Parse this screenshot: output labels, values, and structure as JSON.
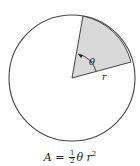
{
  "diagram": {
    "sector_angle_label": "θ",
    "radius_label": "r",
    "sector_fill_color": "#d9d9d9",
    "stroke_color": "#444444"
  },
  "formula": {
    "lhs": "A",
    "equals": "=",
    "frac_num": "1",
    "frac_den": "2",
    "theta": "θ",
    "r": "r",
    "exp": "2"
  }
}
